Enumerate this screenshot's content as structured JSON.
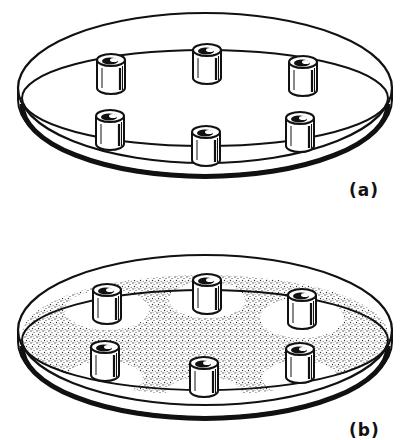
{
  "figure": {
    "panels": [
      {
        "id": "a",
        "label": "(a)",
        "description": "Petri dish with six cylinders placed on clear agar surface",
        "agar": "clear",
        "cylinders": [
          {
            "x": 111,
            "y": 60
          },
          {
            "x": 207,
            "y": 50
          },
          {
            "x": 303,
            "y": 62
          },
          {
            "x": 110,
            "y": 116
          },
          {
            "x": 206,
            "y": 132
          },
          {
            "x": 300,
            "y": 118
          }
        ]
      },
      {
        "id": "b",
        "label": "(b)",
        "description": "Petri dish with six cylinders on stippled (bacterial lawn) agar showing clear inhibition zones around each cylinder",
        "agar": "stippled",
        "cylinders": [
          {
            "x": 107,
            "y": 290
          },
          {
            "x": 207,
            "y": 280
          },
          {
            "x": 302,
            "y": 295
          },
          {
            "x": 105,
            "y": 347
          },
          {
            "x": 204,
            "y": 363
          },
          {
            "x": 300,
            "y": 349
          }
        ]
      }
    ],
    "colors": {
      "ink": "#111111",
      "background": "#ffffff",
      "stipple": "#3a3a3a"
    }
  }
}
